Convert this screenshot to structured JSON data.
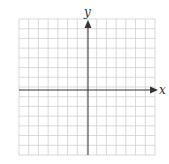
{
  "chart_data": {
    "type": "scatter",
    "title": "",
    "xlabel": "x",
    "ylabel": "y",
    "grid": true,
    "grid_cols": 14,
    "grid_rows": 14,
    "series": []
  },
  "axes": {
    "x_label": "x",
    "y_label": "y"
  },
  "colors": {
    "grid": "#d0d0d0",
    "axis": "#333333"
  }
}
